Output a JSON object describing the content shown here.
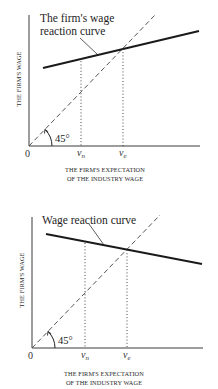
{
  "figures": [
    {
      "id": "top",
      "curve_label_line1": "The firm's wage",
      "curve_label_line2": "reaction curve",
      "y_axis_title": "THE FIRM'S WAGE",
      "x_axis_title_line1": "THE FIRM'S EXPECTATION",
      "x_axis_title_line2": "OF THE INDUSTRY WAGE",
      "origin_label": "0",
      "angle_label": "45°",
      "tick_vn": "v",
      "tick_vn_sub": "n",
      "tick_ve": "v",
      "tick_ve_sub": "e",
      "reaction_curve_slope": "positive (less than 1)"
    },
    {
      "id": "bottom",
      "curve_label_line1": "Wage reaction curve",
      "y_axis_title": "THE FIRM'S WAGE",
      "x_axis_title_line1": "THE FIRM'S EXPECTATION",
      "x_axis_title_line2": "OF THE INDUSTRY WAGE",
      "origin_label": "0",
      "angle_label": "45°",
      "tick_vn": "v",
      "tick_vn_sub": "n",
      "tick_ve": "v",
      "tick_ve_sub": "e",
      "reaction_curve_slope": "negative"
    }
  ],
  "colors": {
    "ink": "#1e1e1e",
    "axis": "#3a3a3a",
    "dashed": "#555555",
    "background": "#ffffff"
  }
}
